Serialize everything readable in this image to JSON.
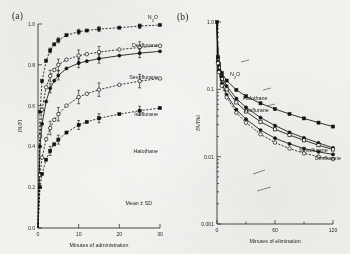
{
  "figure": {
    "panels": [
      {
        "tag": "(a)",
        "xlabel": "Minutes of administration",
        "ylabel": "FA/FI",
        "note": "Mean ± SD"
      },
      {
        "tag": "(b)",
        "xlabel": "Minutes of elimination",
        "ylabel": "FA/FA0",
        "note": ""
      }
    ]
  },
  "chart_data": [
    {
      "type": "line",
      "title": "",
      "panel": "(a)",
      "xlabel": "Minutes of administration",
      "ylabel": "FA/FI",
      "xlim": [
        0,
        30
      ],
      "ylim": [
        0.0,
        1.0
      ],
      "xticks": [
        0,
        10,
        20,
        30
      ],
      "yticks": [
        "0.0",
        "0.2",
        "0.4",
        "0.6",
        "0.8",
        "1.0"
      ],
      "grid": false,
      "legend": "inline-right-labels",
      "annotations": [
        "Mean ± SD"
      ],
      "x": [
        0,
        0.5,
        1,
        2,
        3,
        4,
        5,
        7,
        10,
        12,
        15,
        20,
        25,
        30
      ],
      "series": [
        {
          "name": "N2O",
          "label": "N₂O",
          "marker": "filled-square",
          "linestyle": "dashed",
          "values": [
            0.0,
            0.57,
            0.72,
            0.82,
            0.87,
            0.9,
            0.92,
            0.945,
            0.962,
            0.968,
            0.975,
            0.982,
            0.99,
            0.995
          ]
        },
        {
          "name": "Desflurane",
          "label": "Desflurane",
          "marker": "open-circle",
          "linestyle": "dashed",
          "values": [
            0.0,
            0.45,
            0.58,
            0.69,
            0.745,
            0.775,
            0.8,
            0.825,
            0.845,
            0.852,
            0.862,
            0.875,
            0.885,
            0.893
          ]
        },
        {
          "name": "Sevoflurane",
          "label": "Sevoflurane",
          "marker": "filled-circle",
          "linestyle": "solid",
          "values": [
            0.0,
            0.4,
            0.51,
            0.62,
            0.685,
            0.722,
            0.748,
            0.782,
            0.808,
            0.818,
            0.83,
            0.845,
            0.857,
            0.866
          ]
        },
        {
          "name": "Isoflurane",
          "label": "Isoflurane",
          "marker": "open-circle",
          "linestyle": "dashed",
          "values": [
            0.0,
            0.26,
            0.345,
            0.435,
            0.49,
            0.53,
            0.558,
            0.6,
            0.642,
            0.658,
            0.678,
            0.702,
            0.72,
            0.733
          ]
        },
        {
          "name": "Halothane",
          "label": "Halothane",
          "marker": "filled-square",
          "linestyle": "dashed",
          "values": [
            0.0,
            0.2,
            0.265,
            0.335,
            0.378,
            0.41,
            0.433,
            0.468,
            0.505,
            0.52,
            0.538,
            0.558,
            0.575,
            0.588
          ]
        }
      ]
    },
    {
      "type": "line",
      "title": "",
      "panel": "(b)",
      "xlabel": "Minutes of elimination",
      "ylabel": "FA/FA0",
      "xlim": [
        0,
        120
      ],
      "ylim": [
        0.001,
        1.0
      ],
      "yscale": "log",
      "xticks": [
        0,
        60,
        120
      ],
      "yticks": [
        "0.001",
        "0.01",
        "0.1",
        "1.0"
      ],
      "grid": false,
      "legend": "inline-leader-labels",
      "x": [
        0,
        1,
        2,
        5,
        10,
        20,
        30,
        45,
        60,
        75,
        90,
        105,
        120
      ],
      "series": [
        {
          "name": "N2O",
          "label": "N₂O",
          "marker": "filled-square",
          "linestyle": "solid",
          "values": [
            1.0,
            0.3,
            0.24,
            0.175,
            0.135,
            0.098,
            0.079,
            0.062,
            0.051,
            0.043,
            0.037,
            0.032,
            0.028
          ]
        },
        {
          "name": "Halothane",
          "label": "Halothane",
          "marker": "filled-circle",
          "linestyle": "solid",
          "values": [
            1.0,
            0.29,
            0.225,
            0.155,
            0.112,
            0.073,
            0.054,
            0.038,
            0.029,
            0.023,
            0.019,
            0.016,
            0.0135
          ]
        },
        {
          "name": "Isoflurane",
          "label": "Isoflurane",
          "marker": "open-square",
          "linestyle": "solid",
          "values": [
            1.0,
            0.275,
            0.21,
            0.142,
            0.1,
            0.064,
            0.047,
            0.033,
            0.0255,
            0.021,
            0.0175,
            0.0148,
            0.0128
          ]
        },
        {
          "name": "Sevoflurane",
          "label": "Sevoflurane",
          "marker": "filled-circle",
          "linestyle": "solid",
          "values": [
            1.0,
            0.255,
            0.19,
            0.122,
            0.083,
            0.05,
            0.036,
            0.0248,
            0.0188,
            0.0155,
            0.0132,
            0.0118,
            0.0108
          ]
        },
        {
          "name": "Desflurane",
          "label": "Desflurane",
          "marker": "open-circle",
          "linestyle": "dashed",
          "values": [
            1.0,
            0.245,
            0.18,
            0.113,
            0.076,
            0.045,
            0.032,
            0.0215,
            0.0162,
            0.0132,
            0.0112,
            0.01,
            0.0092
          ]
        }
      ]
    }
  ]
}
